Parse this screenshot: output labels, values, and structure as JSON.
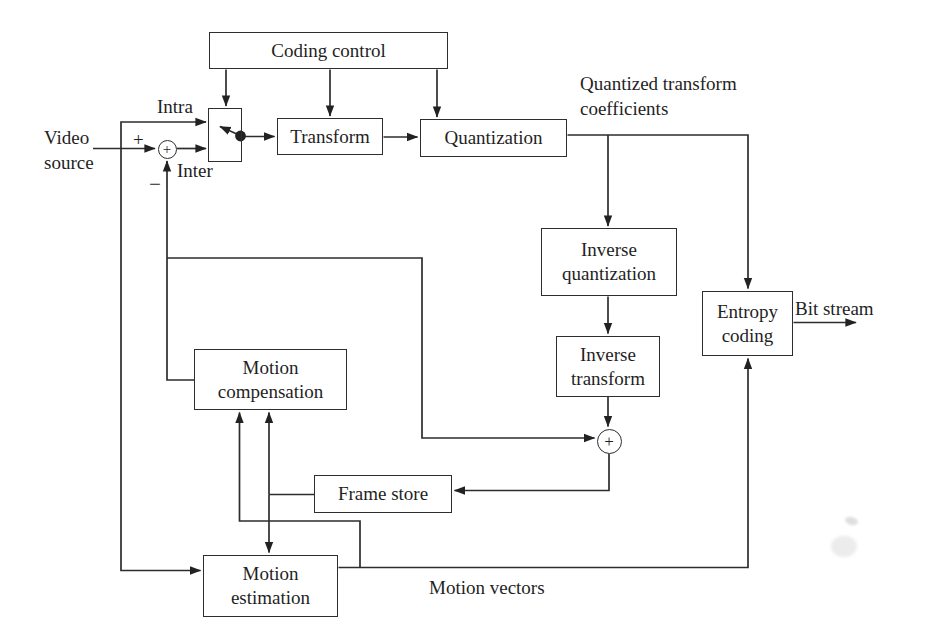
{
  "diagram": {
    "paper_color": "#ffffff",
    "ink_color": "#2d2d2d",
    "boxes": {
      "coding_control": "Coding control",
      "transform": "Transform",
      "quantization": "Quantization",
      "inverse_quantization": "Inverse quantization",
      "inverse_transform": "Inverse transform",
      "entropy_coding": "Entropy coding",
      "frame_store": "Frame store",
      "motion_compensation": "Motion compensation",
      "motion_estimation": "Motion estimation"
    },
    "operators": {
      "subtractor": "+",
      "adder": "+"
    },
    "labels": {
      "video_source": "Video source",
      "intra": "Intra",
      "inter": "Inter",
      "plus": "+",
      "minus": "−",
      "quantized_coefficients": "Quantized transform coefficients",
      "bit_stream": "Bit stream",
      "motion_vectors": "Motion vectors"
    }
  }
}
